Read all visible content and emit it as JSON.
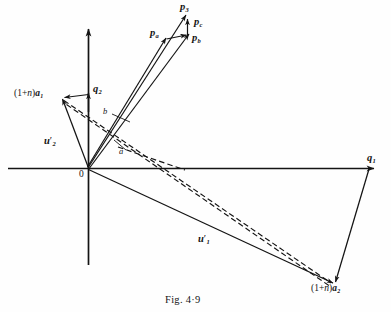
{
  "figure": {
    "caption": "Fig. 4·9",
    "axes": {
      "x_axis_label": "q",
      "x_axis_sub": "1",
      "y_axis_label": "q",
      "y_axis_sub": "2",
      "origin_label": "0"
    },
    "vectors": [
      {
        "id": "p3",
        "label": "p",
        "sub": "3",
        "prime": "",
        "kind": "solid-arrow"
      },
      {
        "id": "pc",
        "label": "p",
        "sub": "c",
        "prime": "",
        "kind": "solid-arrow"
      },
      {
        "id": "pb",
        "label": "p",
        "sub": "b",
        "prime": "",
        "kind": "solid-arrow"
      },
      {
        "id": "pa",
        "label": "p",
        "sub": "a",
        "prime": "",
        "kind": "solid-arrow"
      },
      {
        "id": "u1",
        "label": "u",
        "sub": "1",
        "prime": "′",
        "kind": "solid-arrow"
      },
      {
        "id": "u2",
        "label": "u",
        "sub": "2",
        "prime": "′",
        "kind": "solid-arrow"
      },
      {
        "id": "a1",
        "label": "(1+n)a",
        "sub": "1",
        "prime": "",
        "kind": "solid-arrow"
      },
      {
        "id": "a2",
        "label": "(1+n)a",
        "sub": "2",
        "prime": "",
        "kind": "solid-arrow"
      }
    ],
    "point_labels": [
      {
        "id": "pt_a",
        "text": "a"
      },
      {
        "id": "pt_b",
        "text": "b"
      }
    ],
    "colors": {
      "ink": "#141414",
      "paper": "#fefefe"
    }
  },
  "labels": {
    "p3": {
      "base": "p",
      "sub": "3"
    },
    "pc": {
      "base": "p",
      "sub": "c"
    },
    "pb": {
      "base": "p",
      "sub": "b"
    },
    "pa": {
      "base": "p",
      "sub": "a"
    },
    "q1": {
      "base": "q",
      "sub": "1"
    },
    "q2": {
      "base": "q",
      "sub": "2"
    },
    "u1": {
      "base": "u",
      "sub": "1",
      "prime": "′"
    },
    "u2": {
      "base": "u",
      "sub": "2",
      "prime": "′"
    },
    "a1": {
      "pre": "(1+",
      "n": "n",
      "post": ")",
      "base": "a",
      "sub": "1"
    },
    "a2": {
      "pre": "(1+",
      "n": "n",
      "post": ")",
      "base": "a",
      "sub": "2"
    },
    "small_a": "a",
    "small_b": "b",
    "origin": "0",
    "caption": "Fig. 4·9"
  }
}
